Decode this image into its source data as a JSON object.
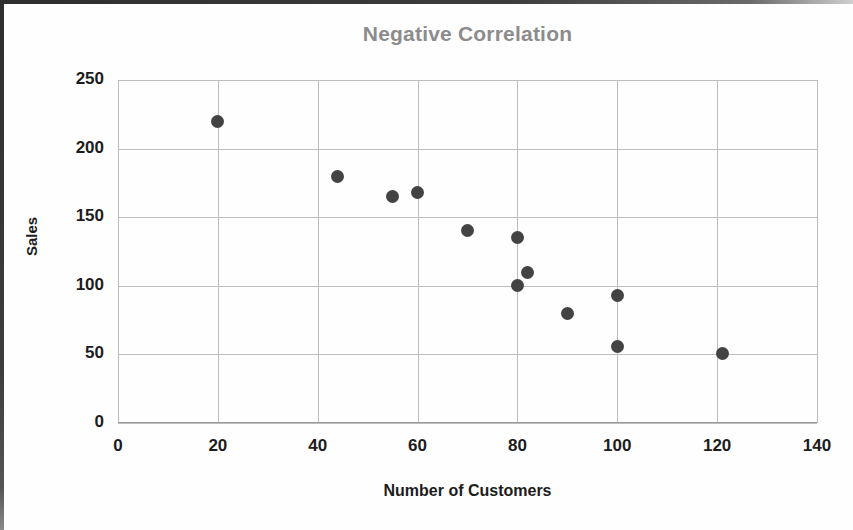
{
  "chart_data": {
    "type": "scatter",
    "title": "Negative Correlation",
    "xlabel": "Number of Customers",
    "ylabel": "Sales",
    "xlim": [
      0,
      140
    ],
    "ylim": [
      0,
      250
    ],
    "xticks": [
      0,
      20,
      40,
      60,
      80,
      100,
      120,
      140
    ],
    "yticks": [
      0,
      50,
      100,
      150,
      200,
      250
    ],
    "grid": true,
    "legend": false,
    "point_color": "#434343",
    "title_color": "#8c8c8c",
    "grid_color": "#bdbdbd",
    "points": [
      {
        "x": 20,
        "y": 220
      },
      {
        "x": 44,
        "y": 180
      },
      {
        "x": 55,
        "y": 165
      },
      {
        "x": 60,
        "y": 168
      },
      {
        "x": 70,
        "y": 140
      },
      {
        "x": 80,
        "y": 135
      },
      {
        "x": 82,
        "y": 110
      },
      {
        "x": 80,
        "y": 100
      },
      {
        "x": 90,
        "y": 80
      },
      {
        "x": 100,
        "y": 93
      },
      {
        "x": 100,
        "y": 56
      },
      {
        "x": 121,
        "y": 51
      }
    ],
    "xtick_labels": [
      "0",
      "20",
      "40",
      "60",
      "80",
      "100",
      "120",
      "140"
    ],
    "ytick_labels": [
      "0",
      "50",
      "100",
      "150",
      "200",
      "250"
    ]
  }
}
